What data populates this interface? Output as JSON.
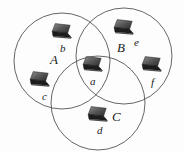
{
  "figure": {
    "kind": "venn-network-diagram",
    "background_color": "#fdfdfd",
    "stroke_color": "#555555",
    "text_color": "#1a1a1a"
  },
  "sets": [
    {
      "id": "A",
      "label": "A",
      "label_x": 50,
      "label_y": 53,
      "cx": 62,
      "cy": 61,
      "r": 48
    },
    {
      "id": "B",
      "label": "B",
      "label_x": 117,
      "label_y": 41,
      "cx": 124,
      "cy": 56,
      "r": 48
    },
    {
      "id": "C",
      "label": "C",
      "label_x": 112,
      "label_y": 110,
      "cx": 98,
      "cy": 103,
      "r": 47
    }
  ],
  "nodes": [
    {
      "id": "a",
      "label": "a",
      "icon": "laptop-icon",
      "icon_x": 82,
      "icon_y": 56,
      "label_x": 90,
      "label_y": 76,
      "membership": "A,B,C"
    },
    {
      "id": "b",
      "label": "b",
      "icon": "laptop-icon",
      "icon_x": 51,
      "icon_y": 23,
      "label_x": 60,
      "label_y": 43,
      "membership": "A"
    },
    {
      "id": "c",
      "label": "c",
      "icon": "laptop-icon",
      "icon_x": 29,
      "icon_y": 71,
      "label_x": 42,
      "label_y": 91,
      "membership": "A"
    },
    {
      "id": "d",
      "label": "d",
      "icon": "laptop-icon",
      "icon_x": 87,
      "icon_y": 106,
      "label_x": 97,
      "label_y": 125,
      "membership": "C"
    },
    {
      "id": "e",
      "label": "e",
      "icon": "laptop-icon",
      "icon_x": 113,
      "icon_y": 19,
      "label_x": 134,
      "label_y": 37,
      "membership": "B"
    },
    {
      "id": "f",
      "label": "f",
      "icon": "laptop-icon",
      "icon_x": 141,
      "icon_y": 56,
      "label_x": 151,
      "label_y": 77,
      "membership": "B"
    }
  ]
}
